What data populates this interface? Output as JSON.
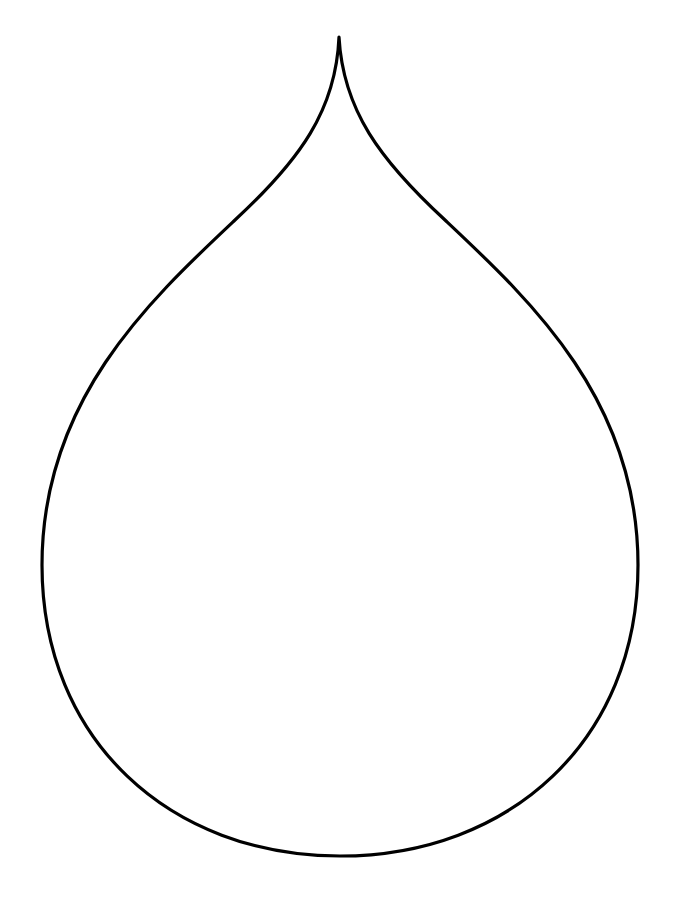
{
  "figure": {
    "shape": "teardrop-outline",
    "stroke_color": "#000000",
    "fill_color": "#ffffff",
    "background": "#ffffff"
  }
}
